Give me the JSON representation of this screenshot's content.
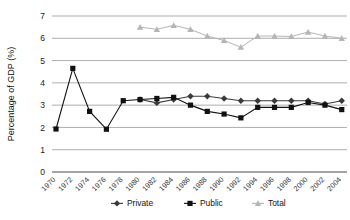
{
  "chart_data": {
    "type": "line",
    "title": "",
    "xlabel": "",
    "ylabel": "Percentage of GDP (%)",
    "ylim": [
      0,
      7
    ],
    "ytick_labels": [
      "0",
      "1",
      "2",
      "3",
      "4",
      "5",
      "6",
      "7"
    ],
    "grid": true,
    "legend_position": "bottom",
    "categories": [
      "1970",
      "1972",
      "1974",
      "1976",
      "1978",
      "1980",
      "1982",
      "1984",
      "1986",
      "1988",
      "1990",
      "1992",
      "1994",
      "1996",
      "1998",
      "2000",
      "2002",
      "2004"
    ],
    "series": [
      {
        "name": "Private",
        "marker": "diamond",
        "color": "#3a3a3a",
        "values": [
          null,
          null,
          null,
          null,
          null,
          3.25,
          3.1,
          3.25,
          3.4,
          3.4,
          3.3,
          3.2,
          3.2,
          3.2,
          3.2,
          3.2,
          3.05,
          3.2
        ]
      },
      {
        "name": "Public",
        "marker": "square",
        "color": "#111111",
        "values": [
          1.93,
          4.65,
          2.72,
          1.92,
          3.2,
          3.25,
          3.3,
          3.35,
          3.0,
          2.72,
          2.6,
          2.43,
          2.9,
          2.9,
          2.9,
          3.12,
          3.0,
          2.8
        ]
      },
      {
        "name": "Total",
        "marker": "triangle",
        "color": "#b5b5b5",
        "values": [
          null,
          null,
          null,
          null,
          null,
          6.5,
          6.4,
          6.58,
          6.4,
          6.1,
          5.9,
          5.6,
          6.1,
          6.1,
          6.08,
          6.28,
          6.1,
          6.0
        ]
      }
    ]
  },
  "legend": {
    "items": [
      {
        "label": "Private"
      },
      {
        "label": "Public"
      },
      {
        "label": "Total"
      }
    ]
  }
}
